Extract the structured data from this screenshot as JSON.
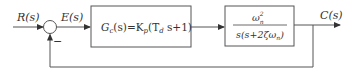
{
  "diagram": {
    "type": "closed-loop control block diagram",
    "input_label": "R(s)",
    "error_label": "E(s)",
    "output_label": "C(s)",
    "summing_junction": {
      "feedback_sign": "−"
    },
    "blocks": [
      {
        "id": "controller",
        "label_lhs": "G",
        "label_sub": "c",
        "label_rest": "(s)=K",
        "kp_sub": "p",
        "label_tail": "(T",
        "td_sub": "d",
        "label_end": " s+1)"
      },
      {
        "id": "plant",
        "numerator": "ω",
        "num_sub": "n",
        "num_sup": "2",
        "denominator": "s(s+2ζω",
        "den_sub": "n",
        "den_end": ")"
      }
    ],
    "feedback": "unity negative"
  }
}
